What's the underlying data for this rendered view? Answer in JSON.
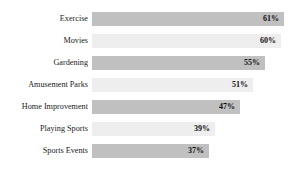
{
  "chart_data": {
    "type": "bar",
    "orientation": "horizontal",
    "title": "",
    "xlabel": "",
    "ylabel": "",
    "xlim": [
      0,
      65
    ],
    "grid": false,
    "legend": null,
    "value_suffix": "%",
    "categories": [
      "Exercise",
      "Movies",
      "Gardening",
      "Amusement Parks",
      "Home Improvement",
      "Playing Sports",
      "Sports Events"
    ],
    "values": [
      61,
      60,
      55,
      51,
      47,
      39,
      37
    ],
    "value_labels": [
      "61%",
      "60%",
      "55%",
      "51%",
      "47%",
      "39%",
      "37%"
    ],
    "bar_colors": [
      "#c0c0c0",
      "#eeeeee",
      "#c0c0c0",
      "#eeeeee",
      "#c0c0c0",
      "#eeeeee",
      "#c0c0c0"
    ]
  },
  "style": {
    "background": "#ffffff",
    "label_color": "#1a1a1a",
    "value_color": "#111111",
    "dark_bar": "#c0c0c0",
    "light_bar": "#eeeeee"
  }
}
